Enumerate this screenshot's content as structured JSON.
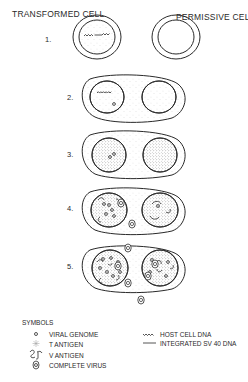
{
  "header": {
    "left": "TRANSFORMED CELL",
    "right": "PERMISSIVE CELL"
  },
  "steps": [
    {
      "label": "1."
    },
    {
      "label": "2."
    },
    {
      "label": "3."
    },
    {
      "label": "4."
    },
    {
      "label": "5."
    }
  ],
  "legend": {
    "title": "SYMBOLS",
    "left_items": [
      {
        "icon": "viral-genome-icon",
        "label": "VIRAL GENOME"
      },
      {
        "icon": "t-antigen-icon",
        "label": "T ANTIGEN"
      },
      {
        "icon": "v-antigen-icon",
        "label": "V ANTIGEN"
      },
      {
        "icon": "complete-virus-icon",
        "label": "COMPLETE VIRUS"
      }
    ],
    "right_items": [
      {
        "icon": "host-cell-dna-icon",
        "label": "HOST CELL DNA"
      },
      {
        "icon": "integrated-sv40-dna-icon",
        "label": "INTEGRATED SV 40 DNA"
      }
    ]
  },
  "colors": {
    "ink": "#2a2a2a",
    "background": "#ffffff",
    "stipple": "#9a9a9a"
  }
}
